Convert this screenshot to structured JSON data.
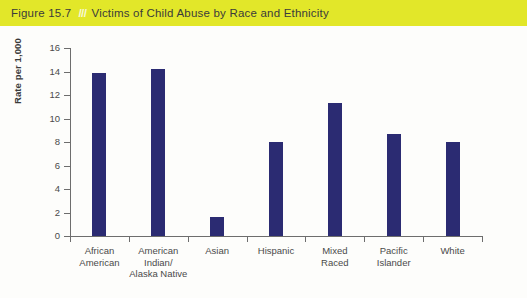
{
  "figure": {
    "number": "Figure 15.7",
    "separator": "///",
    "title": "Victims of Child Abuse by Race and Ethnicity",
    "band_color": "#e2e729",
    "bar_color": "#2b2b72"
  },
  "chart_data": {
    "type": "bar",
    "title": "Victims of Child Abuse by Race and Ethnicity",
    "xlabel": "",
    "ylabel": "Rate per 1,000",
    "ylim": [
      0,
      16
    ],
    "yticks": [
      0,
      2,
      4,
      6,
      8,
      10,
      12,
      14,
      16
    ],
    "ytick_labels": [
      "0",
      "2",
      "4",
      "6",
      "8",
      "10",
      "12",
      "14",
      "16"
    ],
    "grid": false,
    "legend": null,
    "categories": [
      "African\nAmerican",
      "American\nIndian/\nAlaska Native",
      "Asian",
      "Hispanic",
      "Mixed\nRaced",
      "Pacific\nIslander",
      "White"
    ],
    "values": [
      13.9,
      14.2,
      1.6,
      8.0,
      11.3,
      8.7,
      8.0
    ],
    "series": [
      {
        "name": "Rate per 1,000",
        "values": [
          13.9,
          14.2,
          1.6,
          8.0,
          11.3,
          8.7,
          8.0
        ],
        "color": "#2b2b72"
      }
    ]
  }
}
